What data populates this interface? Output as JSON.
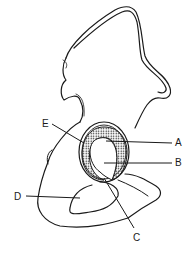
{
  "diagram": {
    "labels": [
      {
        "id": "A",
        "text": "A",
        "x": 175,
        "y": 138
      },
      {
        "id": "B",
        "text": "B",
        "x": 175,
        "y": 158
      },
      {
        "id": "C",
        "text": "C",
        "x": 133,
        "y": 233
      },
      {
        "id": "D",
        "text": "D",
        "x": 14,
        "y": 192
      },
      {
        "id": "E",
        "text": "E",
        "x": 42,
        "y": 119
      }
    ],
    "colors": {
      "line": "#1a1a1a",
      "background": "#ffffff"
    }
  }
}
